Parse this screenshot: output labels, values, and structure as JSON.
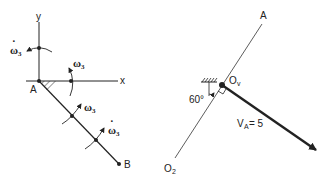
{
  "left_diagram": {
    "axis_x_label": "x",
    "axis_y_label": "y",
    "point_a_label": "A",
    "point_b_label": "B",
    "omega_dot_top": {
      "symbol": "ω",
      "sub": "3",
      "dot": "·"
    },
    "omega_x_axis": {
      "symbol": "ω",
      "sub": "3"
    },
    "omega_on_link": {
      "symbol": "ω",
      "sub": "3"
    },
    "omega_dot_on_link": {
      "symbol": "ω",
      "sub": "3",
      "dot": "·"
    }
  },
  "right_diagram": {
    "top_label": "A",
    "pivot_label": "O",
    "pivot_sub": "v",
    "bottom_label": "O",
    "bottom_sub": "2",
    "angle_label": "60°",
    "velocity_label": "V",
    "velocity_sub": "A",
    "velocity_value": " = 5"
  },
  "colors": {
    "ink": "#222222",
    "background": "#ffffff"
  }
}
